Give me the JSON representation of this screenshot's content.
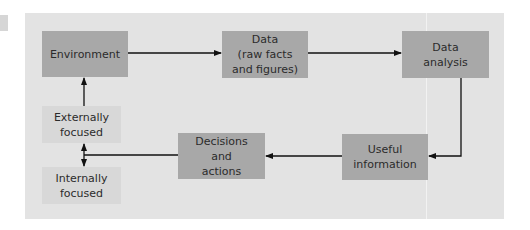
{
  "diagram": {
    "type": "flowchart",
    "nodes": {
      "environment": "Environment",
      "data": [
        "Data",
        "(raw facts",
        "and figures)"
      ],
      "data_analysis": [
        "Data",
        "analysis"
      ],
      "useful_information": [
        "Useful",
        "information"
      ],
      "decisions": [
        "Decisions",
        "and",
        "actions"
      ],
      "externally_focused": [
        "Externally",
        "focused"
      ],
      "internally_focused": [
        "Internally",
        "focused"
      ]
    },
    "edges": [
      [
        "Environment",
        "Data (raw facts and figures)"
      ],
      [
        "Data (raw facts and figures)",
        "Data analysis"
      ],
      [
        "Data analysis",
        "Useful information"
      ],
      [
        "Useful information",
        "Decisions and actions"
      ],
      [
        "Decisions and actions",
        "Externally focused / Internally focused"
      ],
      [
        "Externally focused",
        "Environment"
      ]
    ],
    "colors": {
      "panel": "#e3e3e3",
      "dark_box": "#a8a8a8",
      "light_box": "#d8d8d8",
      "arrow": "#111111"
    }
  }
}
